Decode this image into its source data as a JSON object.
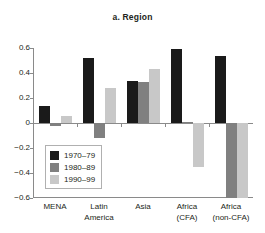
{
  "chart_data": {
    "type": "bar",
    "title": "a. Region",
    "xlabel": "",
    "ylabel": "",
    "ylim": [
      -0.6,
      0.6
    ],
    "yticks": [
      "0.6",
      "0.4",
      "0.2",
      "0",
      "−0.2",
      "−0.4",
      "−0.6"
    ],
    "ytick_values": [
      0.6,
      0.4,
      0.2,
      0,
      -0.2,
      -0.4,
      -0.6
    ],
    "grid": false,
    "legend_position": "inside-lower-left",
    "categories": [
      "MENA",
      "Latin America",
      "Asia",
      "Africa (CFA)",
      "Africa (non-CFA)"
    ],
    "category_lines": [
      [
        "MENA",
        ""
      ],
      [
        "Latin",
        "America"
      ],
      [
        "Asia",
        ""
      ],
      [
        "Africa",
        "(CFA)"
      ],
      [
        "Africa",
        "(non-CFA)"
      ]
    ],
    "series": [
      {
        "name": "1970–79",
        "color": "#1a1a1a",
        "values": [
          0.14,
          0.52,
          0.34,
          0.59,
          0.54
        ]
      },
      {
        "name": "1980–89",
        "color": "#808080",
        "values": [
          -0.025,
          -0.12,
          0.33,
          0.005,
          -0.62
        ]
      },
      {
        "name": "1990–99",
        "color": "#c8c8c8",
        "values": [
          0.06,
          0.28,
          0.43,
          -0.35,
          -0.62
        ]
      }
    ]
  },
  "colors": {
    "axis": "#8a8a8a",
    "text": "#231f20",
    "background": "#ffffff",
    "legend_border": "#b0b0b0"
  }
}
